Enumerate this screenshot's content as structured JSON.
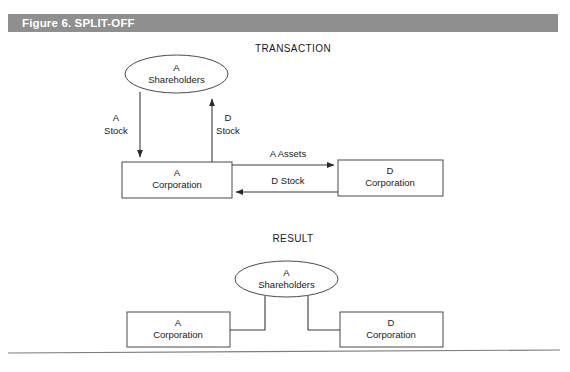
{
  "figure": {
    "header_label": "Figure 6. SPLIT-OFF",
    "header_bar_color": "#8f8f8f",
    "header_text_color": "#ffffff",
    "background_color": "#ffffff",
    "stroke_color": "#4a4a4a"
  },
  "sections": {
    "transaction": {
      "title": "TRANSACTION",
      "shareholders": {
        "line1": "A",
        "line2": "Shareholders"
      },
      "a_corporation": {
        "line1": "A",
        "line2": "Corporation"
      },
      "d_corporation": {
        "line1": "D",
        "line2": "Corporation"
      },
      "edges": {
        "a_stock": {
          "line1": "A",
          "line2": "Stock",
          "direction": "down"
        },
        "d_stock_up": {
          "line1": "D",
          "line2": "Stock",
          "direction": "up"
        },
        "a_assets": {
          "label": "A  Assets",
          "direction": "right"
        },
        "d_stock_left": {
          "label": "D Stock",
          "direction": "left"
        }
      }
    },
    "result": {
      "title": "RESULT",
      "shareholders": {
        "line1": "A",
        "line2": "Shareholders"
      },
      "a_corporation": {
        "line1": "A",
        "line2": "Corporation"
      },
      "d_corporation": {
        "line1": "D",
        "line2": "Corporation"
      }
    }
  }
}
